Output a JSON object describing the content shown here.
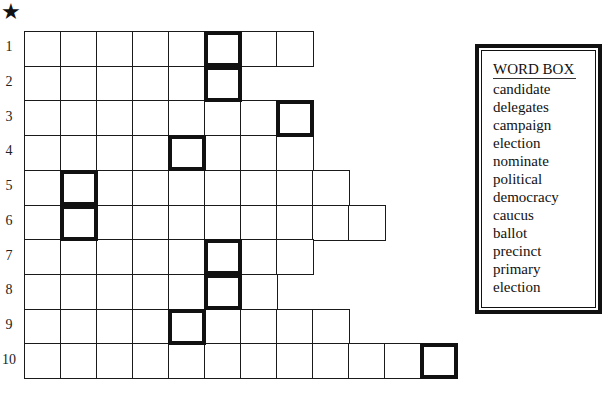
{
  "star_symbol": "★",
  "puzzle": {
    "rows": [
      {
        "number": "1",
        "length": 8,
        "bold_col": 6
      },
      {
        "number": "2",
        "length": 6,
        "bold_col": 6
      },
      {
        "number": "3",
        "length": 8,
        "bold_col": 8
      },
      {
        "number": "4",
        "length": 8,
        "bold_col": 5
      },
      {
        "number": "5",
        "length": 9,
        "bold_col": 2
      },
      {
        "number": "6",
        "length": 10,
        "bold_col": 2
      },
      {
        "number": "7",
        "length": 8,
        "bold_col": 6
      },
      {
        "number": "8",
        "length": 7,
        "bold_col": 6
      },
      {
        "number": "9",
        "length": 9,
        "bold_col": 5
      },
      {
        "number": "10",
        "length": 12,
        "bold_col": 12
      }
    ]
  },
  "word_box": {
    "title": "WORD BOX",
    "words": [
      "candidate",
      "delegates",
      "campaign",
      "election",
      "nominate",
      "political",
      "democracy",
      "caucus",
      "ballot",
      "precinct",
      "primary",
      "election"
    ]
  }
}
